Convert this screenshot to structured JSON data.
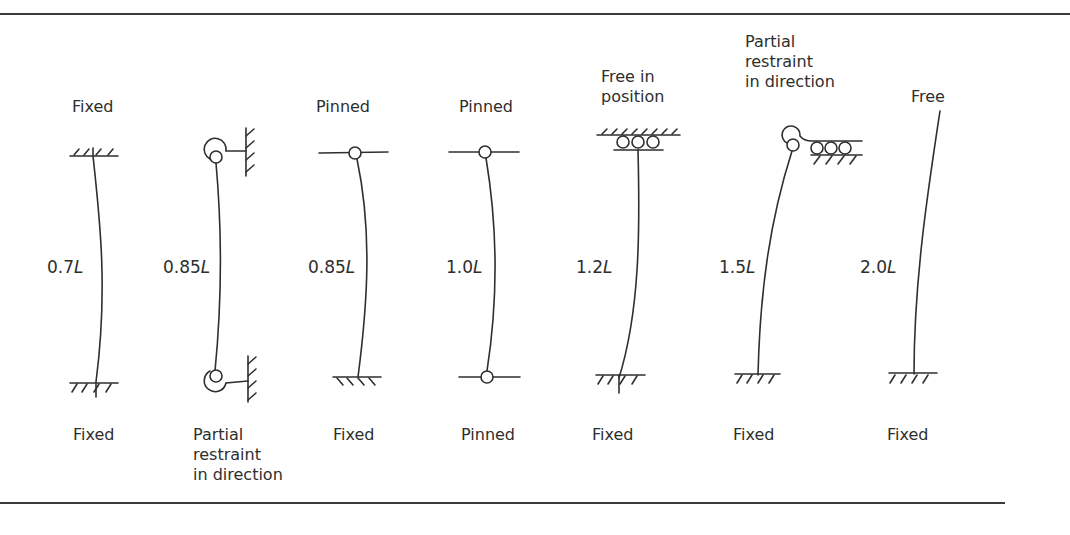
{
  "figure": {
    "columns": [
      {
        "id": "c1",
        "top_condition": "Fixed",
        "bottom_condition": "Fixed",
        "effective_length_factor": "0.7",
        "length_symbol": "L"
      },
      {
        "id": "c2",
        "top_condition": "",
        "bottom_condition": "Partial\nrestraint\nin direction",
        "effective_length_factor": "0.85",
        "length_symbol": "L"
      },
      {
        "id": "c3",
        "top_condition": "Pinned",
        "bottom_condition": "Fixed",
        "effective_length_factor": "0.85",
        "length_symbol": "L"
      },
      {
        "id": "c4",
        "top_condition": "Pinned",
        "bottom_condition": "Pinned",
        "effective_length_factor": "1.0",
        "length_symbol": "L"
      },
      {
        "id": "c5",
        "top_condition": "Free in\nposition",
        "bottom_condition": "Fixed",
        "effective_length_factor": "1.2",
        "length_symbol": "L"
      },
      {
        "id": "c6",
        "top_condition": "Partial\nrestraint\nin direction",
        "bottom_condition": "Fixed",
        "effective_length_factor": "1.5",
        "length_symbol": "L"
      },
      {
        "id": "c7",
        "top_condition": "Free",
        "bottom_condition": "Fixed",
        "effective_length_factor": "2.0",
        "length_symbol": "L"
      }
    ]
  },
  "colors": {
    "line": "#2f2f2f",
    "text": "#2e2e2e",
    "background": "#ffffff"
  }
}
